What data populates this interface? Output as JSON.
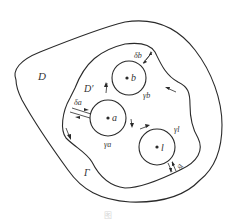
{
  "diagram": {
    "type": "multiply-connected-domain",
    "colors": {
      "stroke": "#2a2a2a",
      "text": "#333333",
      "background": "#ffffff"
    },
    "labels": {
      "outer_domain": "D",
      "inner_domain": "D′",
      "outer_boundary": "Γ",
      "point_a": "a",
      "point_b": "b",
      "point_l": "l",
      "circle_a": "γa",
      "circle_b": "γb",
      "circle_l": "γl",
      "gap_a": "δa",
      "gap_b": "δb",
      "gap_l": "δl"
    },
    "caption": "图"
  }
}
